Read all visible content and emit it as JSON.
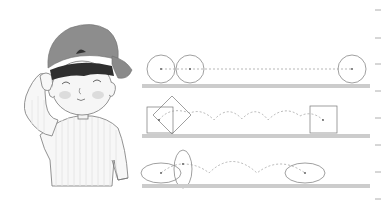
{
  "figure": {
    "character": {
      "name": "boy",
      "accessory": "cap-worn-backwards",
      "expression": "smiling-eyes-closed",
      "pose": "hand-on-head",
      "colors": {
        "cap": "#8a8a8a",
        "cap_band": "#2e2e2e",
        "hair": "#3a3a3a",
        "skin": "#f2f2f2",
        "cheek": "#d8d8d8",
        "outline": "#6e6e6e",
        "shirt_stripe": "#ececec"
      }
    },
    "diagrams": [
      {
        "id": "circle-rolling",
        "shape": "circle",
        "path": "straight-line",
        "start_shapes": 2,
        "end_shapes": 1
      },
      {
        "id": "square-rolling",
        "shape": "square",
        "path": "arcs",
        "arc_count": 4,
        "start_shapes": 2,
        "end_shapes": 1
      },
      {
        "id": "ellipse-rolling",
        "shape": "ellipse",
        "path": "arcs",
        "arc_count": 3,
        "start_shapes": 2,
        "end_shapes": 1
      }
    ],
    "ground_color": "#c8c8c8",
    "line_color": "#777777",
    "path_color": "#9a9a9a",
    "margin_ticks": [
      10,
      38,
      64,
      91,
      118,
      145,
      172,
      199
    ]
  }
}
